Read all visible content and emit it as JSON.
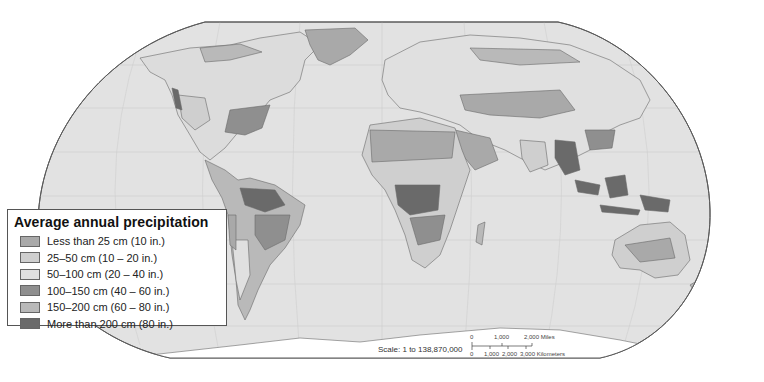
{
  "map": {
    "title": "Average annual precipitation",
    "projection": "Robinson-like world map",
    "colors": {
      "ocean": "#e2e2e2",
      "land_base": "#dcdcdc",
      "antarctica": "#ffffff",
      "border": "#6a6a6a",
      "frame": "#5a5a5a"
    }
  },
  "legend": {
    "title": "Average annual precipitation",
    "items": [
      {
        "label": "Less than 25 cm (10 in.)",
        "color": "#a9a9a9"
      },
      {
        "label": "25–50 cm (10 – 20 in.)",
        "color": "#cfcfcf"
      },
      {
        "label": "50–100 cm (20 – 40 in.)",
        "color": "#e0e0e0"
      },
      {
        "label": "100–150 cm (40 – 60 in.)",
        "color": "#8f8f8f"
      },
      {
        "label": "150–200 cm (60 – 80 in.)",
        "color": "#b9b9b9"
      },
      {
        "label": "More than 200 cm (80 in.)",
        "color": "#6a6a6a"
      }
    ]
  },
  "scale": {
    "label": "Scale:  1 to 138,870,000",
    "miles_ticks": [
      "0",
      "1,000",
      "2,000 Miles"
    ],
    "km_ticks": [
      "0",
      "1,000",
      "2,000",
      "3,000 Kilometers"
    ]
  }
}
